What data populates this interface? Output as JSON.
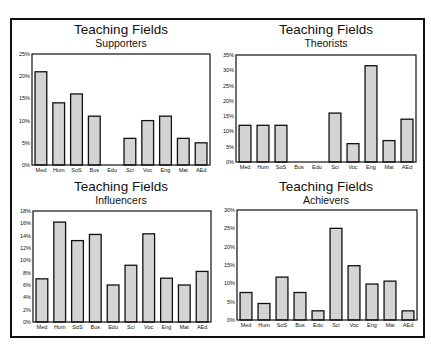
{
  "chart_data": [
    {
      "type": "bar",
      "title": "Teaching Fields",
      "subtitle": "Supporters",
      "xlabel": "",
      "ylabel": "",
      "categories": [
        "Med",
        "Hum",
        "SoS",
        "Bus",
        "Edu",
        "Sci",
        "Voc",
        "Eng",
        "Mat",
        "AEd"
      ],
      "values": [
        21,
        14,
        16,
        11,
        0,
        6,
        10,
        11,
        6,
        5
      ],
      "ylim": [
        0,
        25
      ],
      "yticks": [
        "0%",
        "5%",
        "10%",
        "15%",
        "20%",
        "25%"
      ],
      "ytick_values": [
        0,
        5,
        10,
        15,
        20,
        25
      ],
      "grid": false,
      "bar_color": "#d4d4d4"
    },
    {
      "type": "bar",
      "title": "Teaching Fields",
      "subtitle": "Theorists",
      "xlabel": "",
      "ylabel": "",
      "categories": [
        "Med",
        "Hum",
        "SoS",
        "Bus",
        "Edu",
        "Sci",
        "Voc",
        "Eng",
        "Mat",
        "AEd"
      ],
      "values": [
        12,
        12,
        12,
        0,
        0,
        16,
        6,
        31.5,
        7,
        14
      ],
      "ylim": [
        0,
        35
      ],
      "yticks": [
        "0%",
        "5%",
        "10%",
        "15%",
        "20%",
        "25%",
        "30%",
        "35%"
      ],
      "ytick_values": [
        0,
        5,
        10,
        15,
        20,
        25,
        30,
        35
      ],
      "grid": false,
      "bar_color": "#d4d4d4"
    },
    {
      "type": "bar",
      "title": "Teaching Fields",
      "subtitle": "Influencers",
      "xlabel": "",
      "ylabel": "",
      "categories": [
        "Med",
        "Hum",
        "SoS",
        "Bus",
        "Edu",
        "Sci",
        "Voc",
        "Eng",
        "Mat",
        "AEd"
      ],
      "values": [
        7,
        16.2,
        13.2,
        14.2,
        6,
        9.2,
        14.3,
        7.1,
        6,
        8.2
      ],
      "ylim": [
        0,
        18
      ],
      "yticks": [
        "0%",
        "2%",
        "4%",
        "6%",
        "8%",
        "10%",
        "12%",
        "14%",
        "16%",
        "18%"
      ],
      "ytick_values": [
        0,
        2,
        4,
        6,
        8,
        10,
        12,
        14,
        16,
        18
      ],
      "grid": false,
      "bar_color": "#d4d4d4"
    },
    {
      "type": "bar",
      "title": "Teaching Fields",
      "subtitle": "Achievers",
      "xlabel": "",
      "ylabel": "",
      "categories": [
        "Med",
        "Hum",
        "SoS",
        "Bus",
        "Edu",
        "Sci",
        "Voc",
        "Eng",
        "Mat",
        "AEd"
      ],
      "values": [
        7.5,
        4.5,
        11.7,
        7.5,
        2.5,
        25,
        14.8,
        9.8,
        10.6,
        2.5
      ],
      "ylim": [
        0,
        30
      ],
      "yticks": [
        "0%",
        "5%",
        "10%",
        "15%",
        "20%",
        "25%",
        "30%"
      ],
      "ytick_values": [
        0,
        5,
        10,
        15,
        20,
        25,
        30
      ],
      "grid": false,
      "bar_color": "#d4d4d4"
    }
  ]
}
